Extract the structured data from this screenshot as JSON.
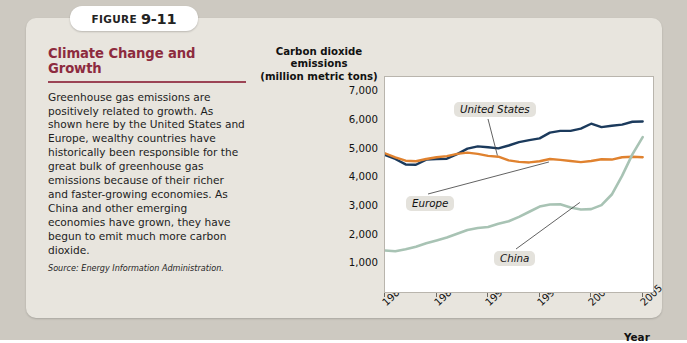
{
  "figure": {
    "tab_label": "FIGURE",
    "tab_number": "9-11",
    "title": "Climate Change and Growth",
    "body": "Greenhouse gas emissions are positively related to growth. As shown here by the United States and Europe, wealthy countries have historically been responsible for the great bulk of greenhouse gas emissions because of their richer and faster-growing economies. As China and other emerging economies have grown, they have begun to emit much more carbon dioxide.",
    "source": "Source: Energy Information Administration."
  },
  "colors": {
    "title": "#8d2b3e",
    "united_states": "#1b3a5c",
    "europe": "#e0822f",
    "china": "#a8c3b4",
    "card": "#e8e5de",
    "page": "#cdc9c1",
    "plot_bg": "#ffffff"
  },
  "chart_data": {
    "type": "line",
    "title": "",
    "ylabel": "Carbon dioxide emissions (million metric tons)",
    "ylabel_lines": [
      "Carbon dioxide",
      "emissions",
      "(million metric tons)"
    ],
    "xlabel": "Year",
    "ylim": [
      0,
      7500
    ],
    "yticks": [
      1000,
      2000,
      3000,
      4000,
      5000,
      6000,
      7000
    ],
    "ytick_labels": [
      "1,000",
      "2,000",
      "3,000",
      "4,000",
      "5,000",
      "6,000",
      "7,000"
    ],
    "xlim": [
      1980,
      2006
    ],
    "xticks": [
      1980,
      1985,
      1990,
      1995,
      2000,
      2005
    ],
    "xtick_labels": [
      "1980",
      "1985",
      "1990",
      "1995",
      "2000",
      "2005"
    ],
    "grid": false,
    "legend_position": "inline-annotations",
    "x": [
      1980,
      1981,
      1982,
      1983,
      1984,
      1985,
      1986,
      1987,
      1988,
      1989,
      1990,
      1991,
      1992,
      1993,
      1994,
      1995,
      1996,
      1997,
      1998,
      1999,
      2000,
      2001,
      2002,
      2003,
      2004,
      2005
    ],
    "series": [
      {
        "name": "United States",
        "color": "#1b3a5c",
        "values": [
          4780,
          4640,
          4450,
          4440,
          4620,
          4640,
          4650,
          4810,
          5000,
          5080,
          5050,
          5010,
          5110,
          5230,
          5300,
          5360,
          5560,
          5620,
          5620,
          5700,
          5870,
          5750,
          5800,
          5840,
          5940,
          5950
        ]
      },
      {
        "name": "Europe",
        "color": "#e0822f",
        "values": [
          4840,
          4700,
          4580,
          4560,
          4640,
          4700,
          4740,
          4820,
          4860,
          4820,
          4750,
          4720,
          4590,
          4540,
          4520,
          4560,
          4640,
          4610,
          4570,
          4530,
          4570,
          4630,
          4620,
          4700,
          4720,
          4700
        ]
      },
      {
        "name": "China",
        "color": "#a8c3b4",
        "values": [
          1450,
          1420,
          1490,
          1580,
          1700,
          1800,
          1900,
          2030,
          2160,
          2230,
          2270,
          2380,
          2470,
          2620,
          2800,
          2980,
          3050,
          3060,
          2950,
          2880,
          2890,
          3030,
          3400,
          4050,
          4800,
          5400
        ]
      }
    ],
    "annotations": [
      {
        "label": "United States",
        "series": "United States",
        "at_x": 1991
      },
      {
        "label": "Europe",
        "series": "Europe",
        "at_x": 1996
      },
      {
        "label": "China",
        "series": "China",
        "at_x": 1999
      }
    ]
  }
}
